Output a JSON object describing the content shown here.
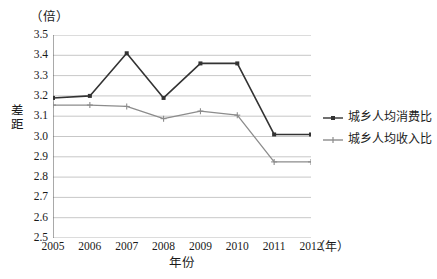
{
  "chart_data": {
    "type": "line",
    "title": "",
    "xlabel": "年份",
    "ylabel": "差距",
    "x_unit": "（年）",
    "y_unit": "（倍）",
    "categories": [
      "2005",
      "2006",
      "2007",
      "2008",
      "2009",
      "2010",
      "2011",
      "2012"
    ],
    "xlim": [
      2005,
      2012
    ],
    "ylim": [
      2.5,
      3.5
    ],
    "y_ticks": [
      "3.5",
      "3.4",
      "3.3",
      "3.2",
      "3.1",
      "3.0",
      "2.9",
      "2.8",
      "2.7",
      "2.6",
      "2.5"
    ],
    "y_tick_values": [
      3.5,
      3.4,
      3.3,
      3.2,
      3.1,
      3.0,
      2.9,
      2.8,
      2.7,
      2.6,
      2.5
    ],
    "grid": true,
    "legend_position": "right",
    "series": [
      {
        "name": "城乡人均消费比",
        "color": "#333333",
        "marker": "square",
        "values": [
          3.19,
          3.2,
          3.41,
          3.19,
          3.36,
          3.36,
          3.01,
          3.01
        ]
      },
      {
        "name": "城乡人均收入比",
        "color": "#8c8c8c",
        "marker": "cross",
        "values": [
          3.155,
          3.155,
          3.148,
          3.088,
          3.125,
          3.105,
          2.875,
          2.875
        ]
      }
    ]
  }
}
